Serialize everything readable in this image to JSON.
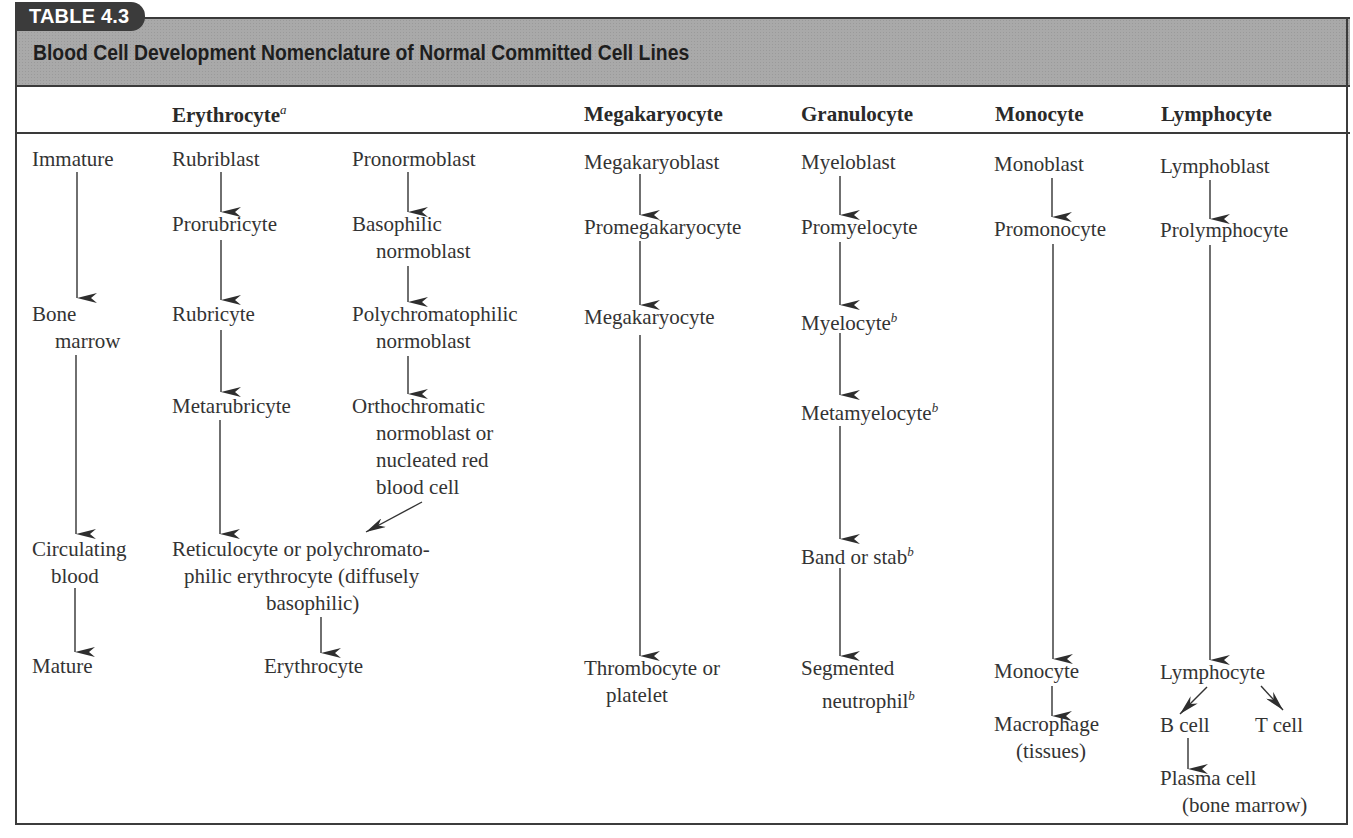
{
  "table": {
    "label": "TABLE 4.3",
    "title": "Blood Cell Development Nomenclature of Normal Committed Cell Lines",
    "columns": [
      {
        "label": "",
        "key": "stage"
      },
      {
        "label": "Erythrocyte",
        "footnote": "a",
        "key": "erythrocyte"
      },
      {
        "label": "Megakaryocyte",
        "key": "megakaryocyte"
      },
      {
        "label": "Granulocyte",
        "key": "granulocyte"
      },
      {
        "label": "Monocyte",
        "key": "monocyte"
      },
      {
        "label": "Lymphocyte",
        "key": "lymphocyte"
      }
    ],
    "stages": {
      "immature": "Immature",
      "bone_marrow": [
        "Bone",
        "marrow"
      ],
      "circulating_blood": [
        "Circulating",
        "blood"
      ],
      "mature": "Mature"
    },
    "erythrocyte": {
      "rubriblast_series": [
        "Rubriblast",
        "Prorubricyte",
        "Rubricyte",
        "Metarubricyte"
      ],
      "normoblast_series": {
        "pronormoblast": [
          "Pronormoblast"
        ],
        "basophilic": [
          "Basophilic",
          "normoblast"
        ],
        "polychromatophilic": [
          "Polychromatophilic",
          "normoblast"
        ],
        "orthochromatic": [
          "Orthochromatic",
          "normoblast or",
          "nucleated red",
          "blood cell"
        ]
      },
      "reticulocyte": [
        "Reticulocyte or polychromato-",
        "philic erythrocyte (diffusely",
        "basophilic)"
      ],
      "mature": "Erythrocyte"
    },
    "megakaryocyte": {
      "stages": [
        "Megakaryoblast",
        "Promegakaryocyte",
        "Megakaryocyte"
      ],
      "mature": [
        "Thrombocyte or",
        "platelet"
      ]
    },
    "granulocyte": {
      "stages": [
        "Myeloblast",
        "Promyelocyte",
        "Myelocyte",
        "Metamyelocyte",
        "Band or stab"
      ],
      "mature": [
        "Segmented",
        "neutrophil"
      ],
      "footnote": "b"
    },
    "monocyte": {
      "stages": [
        "Monoblast",
        "Promonocyte"
      ],
      "mature": "Monocyte",
      "tissue": [
        "Macrophage",
        "(tissues)"
      ]
    },
    "lymphocyte": {
      "stages": [
        "Lymphoblast",
        "Prolymphocyte"
      ],
      "mature": "Lymphocyte",
      "b_cell": "B cell",
      "t_cell": "T cell",
      "plasma": [
        "Plasma cell",
        "(bone marrow)"
      ]
    }
  },
  "colors": {
    "band": "#a9a9a9",
    "tab": "#3b3b3b",
    "line": "#3a3a3a",
    "text": "#333333"
  }
}
